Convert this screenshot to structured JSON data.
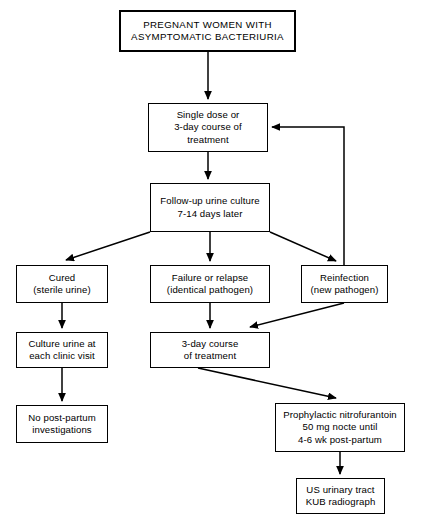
{
  "diagram": {
    "type": "flowchart",
    "background_color": "#ffffff",
    "line_color": "#000000",
    "text_color": "#000000",
    "nodes": [
      {
        "id": "start",
        "label": "PREGNANT WOMEN WITH\nASYMPTOMATIC BACTERIURIA",
        "x": 119,
        "y": 10,
        "w": 177,
        "h": 42,
        "style": "emphasis"
      },
      {
        "id": "treatment1",
        "label": "Single dose or\n3-day course of\ntreatment",
        "x": 148,
        "y": 103,
        "w": 120,
        "h": 49,
        "style": "normal"
      },
      {
        "id": "followup",
        "label": "Follow-up urine culture\n7-14 days later",
        "x": 150,
        "y": 183,
        "w": 120,
        "h": 49,
        "style": "normal"
      },
      {
        "id": "cured",
        "label": "Cured\n(sterile urine)",
        "x": 16,
        "y": 265,
        "w": 92,
        "h": 38,
        "style": "normal"
      },
      {
        "id": "failure",
        "label": "Failure or relapse\n(identical pathogen)",
        "x": 150,
        "y": 265,
        "w": 120,
        "h": 38,
        "style": "normal"
      },
      {
        "id": "reinfection",
        "label": "Reinfection\n(new pathogen)",
        "x": 301,
        "y": 265,
        "w": 87,
        "h": 38,
        "style": "normal"
      },
      {
        "id": "culture-each-visit",
        "label": "Culture urine at\neach clinic visit",
        "x": 16,
        "y": 332,
        "w": 92,
        "h": 36,
        "style": "normal"
      },
      {
        "id": "treatment2",
        "label": "3-day course\nof treatment",
        "x": 150,
        "y": 332,
        "w": 120,
        "h": 36,
        "style": "normal"
      },
      {
        "id": "no-postpartum",
        "label": "No post-partum\ninvestigations",
        "x": 16,
        "y": 405,
        "w": 92,
        "h": 38,
        "style": "normal"
      },
      {
        "id": "prophylaxis",
        "label": "Prophylactic nitrofurantoin\n50 mg nocte until\n4-6 wk post-partum",
        "x": 275,
        "y": 403,
        "w": 130,
        "h": 49,
        "style": "normal"
      },
      {
        "id": "imaging",
        "label": "US urinary tract\nKUB radiograph",
        "x": 296,
        "y": 478,
        "w": 89,
        "h": 36,
        "style": "normal"
      }
    ],
    "edges": [
      {
        "id": "start-to-treatment1",
        "from": "start",
        "to": "treatment1",
        "kind": "straight-down"
      },
      {
        "id": "treatment1-to-followup",
        "from": "treatment1",
        "to": "followup",
        "kind": "straight-down"
      },
      {
        "id": "followup-to-cured",
        "from": "followup",
        "to": "cured",
        "kind": "diagonal-left"
      },
      {
        "id": "followup-to-failure",
        "from": "followup",
        "to": "failure",
        "kind": "straight-down"
      },
      {
        "id": "followup-to-reinfection",
        "from": "followup",
        "to": "reinfection",
        "kind": "diagonal-right"
      },
      {
        "id": "cured-to-culture",
        "from": "cured",
        "to": "culture-each-visit",
        "kind": "straight-down"
      },
      {
        "id": "failure-to-treatment2",
        "from": "failure",
        "to": "treatment2",
        "kind": "straight-down"
      },
      {
        "id": "reinfection-to-treatment1",
        "from": "reinfection",
        "to": "treatment1",
        "kind": "feedback-loop"
      },
      {
        "id": "reinfection-to-treatment2",
        "from": "reinfection",
        "to": "treatment2",
        "kind": "diagonal-left"
      },
      {
        "id": "culture-to-no-postpartum",
        "from": "culture-each-visit",
        "to": "no-postpartum",
        "kind": "straight-down"
      },
      {
        "id": "treatment2-to-prophylaxis",
        "from": "treatment2",
        "to": "prophylaxis",
        "kind": "diagonal-right"
      },
      {
        "id": "prophylaxis-to-imaging",
        "from": "prophylaxis",
        "to": "imaging",
        "kind": "straight-down"
      }
    ]
  }
}
